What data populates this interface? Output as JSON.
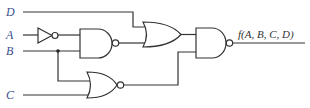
{
  "diagram": {
    "type": "logic-circuit",
    "inputs": [
      {
        "name": "D",
        "label": "D"
      },
      {
        "name": "A",
        "label": "A"
      },
      {
        "name": "B",
        "label": "B"
      },
      {
        "name": "C",
        "label": "C"
      }
    ],
    "output_label": "f(A, B, C, D)",
    "gates": [
      {
        "id": "not1",
        "type": "NOT",
        "inputs": [
          "A"
        ]
      },
      {
        "id": "nand1",
        "type": "NAND",
        "inputs": [
          "not1",
          "B"
        ]
      },
      {
        "id": "or1",
        "type": "OR",
        "inputs": [
          "D",
          "nand1"
        ]
      },
      {
        "id": "nor1",
        "type": "NOR",
        "inputs": [
          "B",
          "C"
        ]
      },
      {
        "id": "nand2",
        "type": "NAND",
        "inputs": [
          "or1",
          "nor1"
        ],
        "output": "f(A, B, C, D)"
      }
    ],
    "colors": {
      "label": "#3a4f8c",
      "wire": "#333333"
    }
  }
}
